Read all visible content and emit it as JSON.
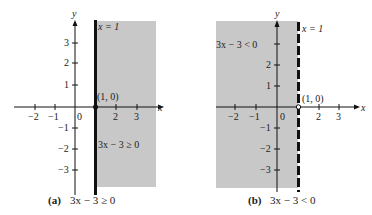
{
  "panels": [
    {
      "id": "a",
      "caption_letter": "(a)",
      "caption_text": "3x − 3 ≥ 0",
      "boundary_label": "x = 1",
      "point_label": "(1, 0)",
      "region_label": "3x − 3 ≥ 0",
      "boundary_style": "solid",
      "shaded_side": "right"
    },
    {
      "id": "b",
      "caption_letter": "(b)",
      "caption_text": "3x − 3 < 0",
      "boundary_label": "x = 1",
      "point_label": "(1, 0)",
      "region_label": "3x − 3 < 0",
      "boundary_style": "dashed",
      "shaded_side": "left"
    }
  ],
  "axes": {
    "x_label": "x",
    "y_label": "y",
    "x_ticks": [
      "−2",
      "−1",
      "0",
      "2",
      "3"
    ],
    "y_ticks_pos": [
      "3",
      "2",
      "1"
    ],
    "y_ticks_neg": [
      "−1",
      "−2",
      "−3"
    ]
  },
  "colors": {
    "shade": "#c8c8c8",
    "ink": "#111111"
  }
}
